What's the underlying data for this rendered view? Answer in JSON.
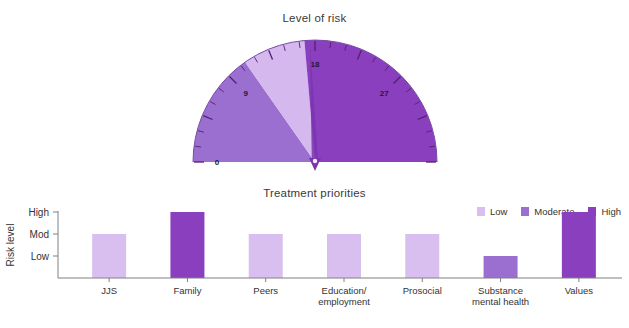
{
  "colors": {
    "low": "#D9BFF0",
    "moderate": "#9B6FD0",
    "high": "#8A3FBF",
    "gauge_low": "#D4B8EE",
    "gauge_moderate": "#9B6FD0",
    "gauge_high": "#8A3FBF",
    "needle": "#7A35AE",
    "axis": "#808080",
    "text": "#333333"
  },
  "gauge": {
    "title": "Level of risk",
    "min": 0,
    "max": 36,
    "tick_labels": [
      {
        "value": 0,
        "text": "0"
      },
      {
        "value": 9,
        "text": "9"
      },
      {
        "value": 18,
        "text": "18"
      },
      {
        "value": 27,
        "text": "27"
      }
    ],
    "bands": [
      {
        "name": "Moderate",
        "from": 0,
        "to": 11,
        "color": "#9B6FD0"
      },
      {
        "name": "Low",
        "from": 11,
        "to": 17,
        "color": "#D4B8EE"
      },
      {
        "name": "High",
        "from": 17,
        "to": 36,
        "color": "#8A3FBF"
      }
    ],
    "needle_value": 17.5,
    "minor_tick_step": 1.5
  },
  "chart_data": {
    "type": "bar",
    "title": "Treatment priorities",
    "xlabel": "",
    "ylabel": "Risk level",
    "ytick_labels": [
      "High",
      "Mod",
      "Low"
    ],
    "ytick_values": [
      3,
      2,
      1
    ],
    "ylim": [
      0,
      3.35
    ],
    "grid": false,
    "legend_position": "top-right",
    "categories": [
      "JJS",
      "Family",
      "Peers",
      "Education/ employment",
      "Prosocial",
      "Substance mental health",
      "Values"
    ],
    "category_lines": [
      [
        "JJS"
      ],
      [
        "Family"
      ],
      [
        "Peers"
      ],
      [
        "Education/",
        "employment"
      ],
      [
        "Prosocial"
      ],
      [
        "Substance",
        "mental health"
      ],
      [
        "Values"
      ]
    ],
    "values": [
      2,
      3,
      2,
      2,
      2,
      1,
      3
    ],
    "value_labels": [
      "Mod",
      "High",
      "Mod",
      "Mod",
      "Mod",
      "Low",
      "High"
    ],
    "bar_levels": [
      "Low",
      "High",
      "Low",
      "Low",
      "Low",
      "Moderate",
      "High"
    ],
    "bar_colors": [
      "#D9BFF0",
      "#8A3FBF",
      "#D9BFF0",
      "#D9BFF0",
      "#D9BFF0",
      "#9B6FD0",
      "#8A3FBF"
    ]
  },
  "legend": {
    "items": [
      {
        "label": "Low",
        "color": "#D9BFF0"
      },
      {
        "label": "Moderate",
        "color": "#9B6FD0"
      },
      {
        "label": "High",
        "color": "#8A3FBF"
      }
    ]
  }
}
